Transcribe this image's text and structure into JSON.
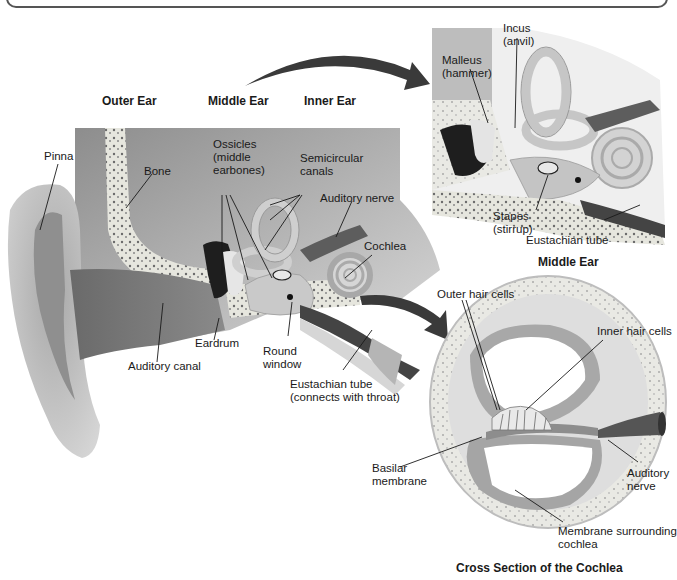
{
  "figure": {
    "section_headers": {
      "outer_ear": "Outer Ear",
      "middle_ear": "Middle Ear",
      "inner_ear": "Inner Ear"
    },
    "main_labels": {
      "pinna": "Pinna",
      "bone": "Bone",
      "ossicles": "Ossicles\n(middle\nearbones)",
      "semicircular_canals": "Semicircular\ncanals",
      "auditory_nerve": "Auditory nerve",
      "cochlea": "Cochlea",
      "eardrum": "Eardrum",
      "round_window": "Round\nwindow",
      "auditory_canal": "Auditory canal",
      "eustachian_tube": "Eustachian tube\n(connects with throat)"
    },
    "middle_ear_inset": {
      "caption": "Middle Ear",
      "incus": "Incus\n(anvil)",
      "malleus": "Malleus\n(hammer)",
      "stapes": "Stapes\n(stirrup)",
      "eustachian_tube": "Eustachian tube"
    },
    "cochlea_inset": {
      "caption": "Cross Section of the Cochlea",
      "outer_hair_cells": "Outer hair cells",
      "inner_hair_cells": "Inner hair cells",
      "basilar_membrane": "Basilar\nmembrane",
      "auditory_nerve": "Auditory\nnerve",
      "membrane_surrounding": "Membrane surrounding\ncochlea"
    },
    "colors": {
      "tissue_dark": "#6e6e6e",
      "tissue_mid": "#9a9a9a",
      "tissue_light": "#cfcfcf",
      "bone": "#e4e4dc",
      "arrow": "#3a3a3a"
    }
  }
}
